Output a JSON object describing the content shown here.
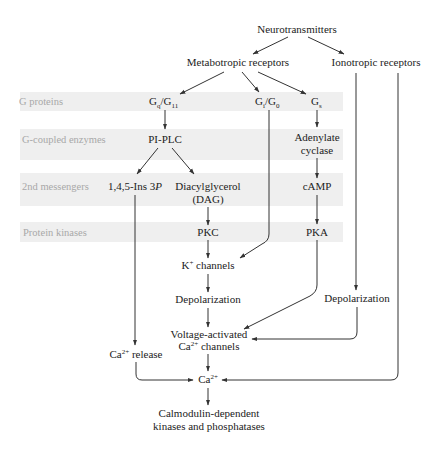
{
  "diagram": {
    "rows": [
      {
        "label": "G proteins"
      },
      {
        "label": "G-coupled enzymes"
      },
      {
        "label": "2nd messengers"
      },
      {
        "label": "Protein kinases"
      }
    ],
    "nodes": {
      "neurotransmitters": "Neurotransmitters",
      "metabotropic": "Metabotropic receptors",
      "ionotropic": "Ionotropic receptors",
      "gq_main": "G",
      "gq_sub": "q",
      "gq_sep": "/G",
      "g11_sub": "11",
      "gi_main": "G",
      "gi_sub": "i",
      "gi_sep": "/G",
      "g0_sub": "0",
      "gs_main": "G",
      "gs_sub": "s",
      "pi_plc": "PI-PLC",
      "adenylate_line1": "Adenylate",
      "adenylate_line2": "cyclase",
      "ins3p_prefix": "1,4,5-Ins 3",
      "ins3p_italic": "P",
      "dag_line1": "Diacylglycerol",
      "dag_line2": "(DAG)",
      "camp": "cAMP",
      "pkc": "PKC",
      "pka": "PKA",
      "k_main": "K",
      "k_sup": "+",
      "k_rest": " channels",
      "depol_left": "Depolarization",
      "depol_right": "Depolarization",
      "vac_line1": "Voltage-activated",
      "vac_ca": "Ca",
      "vac_sup": "2+",
      "vac_rest": " channels",
      "ca_release_main": "Ca",
      "ca_release_sup": "2+",
      "ca_release_rest": " release",
      "ca_main": "Ca",
      "ca_sup": "2+",
      "calmodulin_line1": "Calmodulin-dependent",
      "calmodulin_line2": "kinases and phosphatases"
    },
    "colors": {
      "band": "#efefef",
      "row_label": "#a8a8a8",
      "text": "#222222",
      "line": "#333333"
    }
  }
}
